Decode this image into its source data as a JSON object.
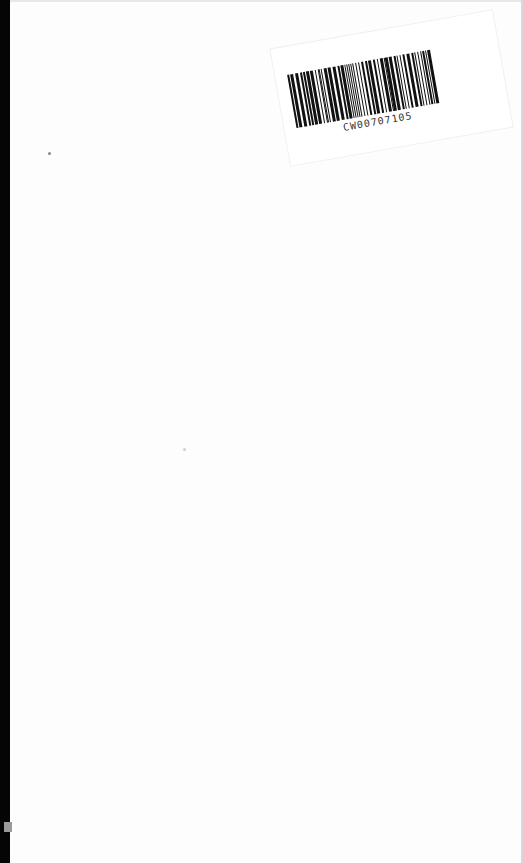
{
  "document": {
    "type": "scanned-blank-page",
    "background_color": "#fdfdfd",
    "scan_edge_color": "#050505"
  },
  "sticker": {
    "barcode_text": "CW00707105",
    "barcode_icon": "barcode-icon"
  }
}
